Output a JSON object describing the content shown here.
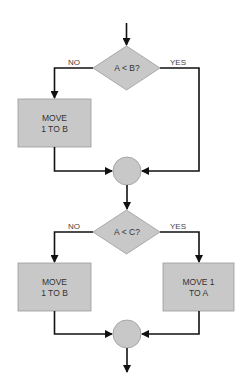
{
  "diagram": {
    "type": "flowchart",
    "colors": {
      "shape_fill": "#c8c8c8",
      "shape_stroke": "#9a9a9a",
      "edge": "#111111",
      "text": "#333333"
    },
    "nodes": {
      "decision1": {
        "label": "A < B?"
      },
      "process1": {
        "line1": "MOVE",
        "line2": "1 TO B"
      },
      "connector1": {
        "label": ""
      },
      "decision2": {
        "label": "A < C?"
      },
      "process2": {
        "line1": "MOVE",
        "line2": "1 TO B"
      },
      "process3": {
        "line1": "MOVE 1",
        "line2": "TO A"
      },
      "connector2": {
        "label": ""
      }
    },
    "edges": {
      "d1_no": "NO",
      "d1_yes": "YES",
      "d2_no": "NO",
      "d2_yes": "YES"
    }
  }
}
